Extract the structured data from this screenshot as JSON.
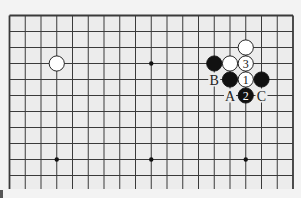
{
  "diagram": {
    "type": "go-board-fragment",
    "columns": 19,
    "visible_rows": 11,
    "bottom_edge_open": true,
    "colors": {
      "background": "#ececec",
      "outer": "#f3f3f3",
      "line": "#3a3a3a",
      "black_stone": "#111111",
      "white_stone": "#ffffff"
    },
    "star_points": [
      {
        "col": 4,
        "row": 4
      },
      {
        "col": 10,
        "row": 4
      },
      {
        "col": 16,
        "row": 4
      },
      {
        "col": 4,
        "row": 10
      },
      {
        "col": 10,
        "row": 10
      },
      {
        "col": 16,
        "row": 10
      }
    ],
    "stones": [
      {
        "col": 4,
        "row": 4,
        "color": "white",
        "label": ""
      },
      {
        "col": 16,
        "row": 3,
        "color": "white",
        "label": ""
      },
      {
        "col": 14,
        "row": 4,
        "color": "black",
        "label": ""
      },
      {
        "col": 15,
        "row": 4,
        "color": "white",
        "label": ""
      },
      {
        "col": 16,
        "row": 4,
        "color": "white",
        "label": "3"
      },
      {
        "col": 15,
        "row": 5,
        "color": "black",
        "label": ""
      },
      {
        "col": 16,
        "row": 5,
        "color": "white",
        "label": "1"
      },
      {
        "col": 17,
        "row": 5,
        "color": "black",
        "label": ""
      },
      {
        "col": 16,
        "row": 6,
        "color": "black",
        "label": "2"
      }
    ],
    "letters": [
      {
        "col": 14,
        "row": 5,
        "text": "B"
      },
      {
        "col": 15,
        "row": 6,
        "text": "A"
      },
      {
        "col": 17,
        "row": 6,
        "text": "C"
      }
    ]
  }
}
